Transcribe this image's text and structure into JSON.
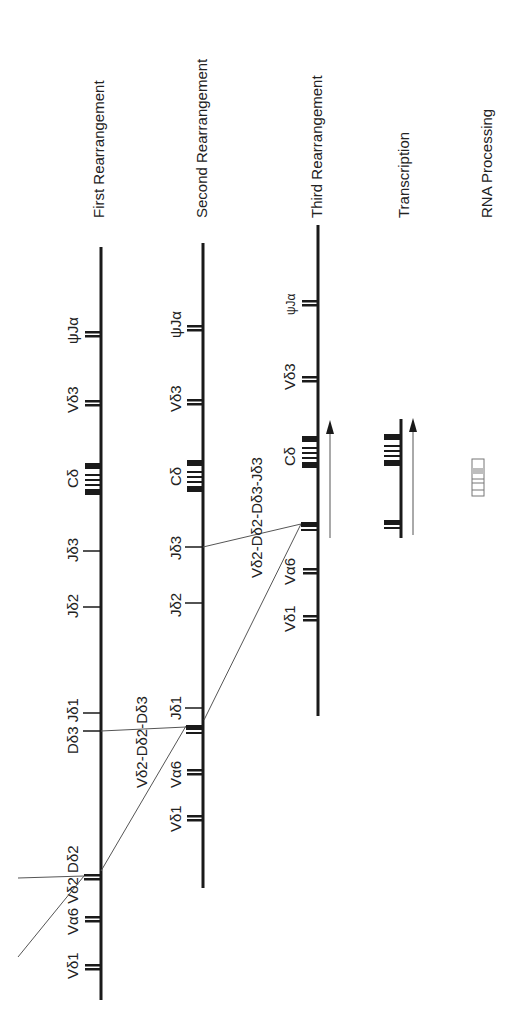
{
  "figure": {
    "steps": [
      {
        "id": "first",
        "title": "First Rearrangement"
      },
      {
        "id": "second",
        "title": "Second Rearrangement"
      },
      {
        "id": "third",
        "title": "Third Rearrangement"
      },
      {
        "id": "transcription",
        "title": "Transcription"
      },
      {
        "id": "rna",
        "title": "RNA Processing"
      }
    ],
    "first": {
      "labels": {
        "psiJa": "ψJα",
        "vd3": "Vδ3",
        "cd": "Cδ",
        "jd3": "Jδ3",
        "jd2": "Jδ2",
        "dd3_jd1": "Dδ3  Jδ1",
        "va6_vd2_dd2": "Vα6 Vδ2 Dδ2",
        "vd1": "Vδ1"
      }
    },
    "second": {
      "labels": {
        "psiJa": "ψJα",
        "vd3": "Vδ3",
        "cd": "Cδ",
        "jd3": "Jδ3",
        "jd2": "Jδ2",
        "jd1": "Jδ1",
        "joined": "Vδ2-Dδ2-Dδ3",
        "va6": "Vα6",
        "vd1": "Vδ1"
      }
    },
    "third": {
      "labels": {
        "psiJa": "ψJα",
        "vd3": "Vδ3",
        "cd": "Cδ",
        "joined": "Vδ2-Dδ2-Dδ3-Jδ3",
        "va6": "Vα6",
        "vd1": "Vδ1"
      }
    },
    "colors": {
      "ink": "#1a1a1a",
      "thin_line": "#555555",
      "rna_fill": "#bdbdbd"
    }
  }
}
